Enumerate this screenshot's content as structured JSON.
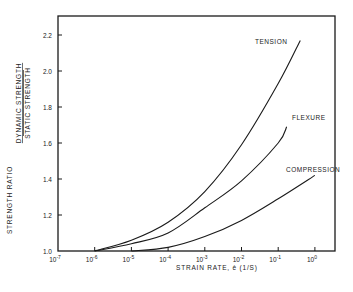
{
  "chart_data": {
    "type": "line",
    "title": "",
    "xlabel": "STRAIN RATE, ė (1/S)",
    "ylabel": "STRENGTH RATIO",
    "ylabel_fraction": {
      "numerator": "DYNAMIC STRENGTH",
      "denominator": "STATIC STRENGTH"
    },
    "xscale": "log",
    "xlim": [
      1e-07,
      3
    ],
    "ylim": [
      1.0,
      2.3
    ],
    "x_ticks": [
      "10-7",
      "10-6",
      "10-5",
      "10-4",
      "10-3",
      "10-2",
      "10-1",
      "100"
    ],
    "x_tick_exponents": [
      -7,
      -6,
      -5,
      -4,
      -3,
      -2,
      -1,
      0
    ],
    "y_ticks": [
      "1.0",
      "1.2",
      "1.4",
      "1.6",
      "1.8",
      "2.0",
      "2.2"
    ],
    "y_tick_values": [
      1.0,
      1.2,
      1.4,
      1.6,
      1.8,
      2.0,
      2.2
    ],
    "grid": false,
    "legend": "inline labels at curve ends",
    "series": [
      {
        "name": "TENSION",
        "x": [
          1e-06,
          1e-05,
          0.0001,
          0.001,
          0.01,
          0.1,
          0.4
        ],
        "y": [
          1.0,
          1.06,
          1.16,
          1.33,
          1.59,
          1.93,
          2.17
        ]
      },
      {
        "name": "FLEXURE",
        "x": [
          1e-06,
          1e-05,
          0.0001,
          0.001,
          0.01,
          0.1,
          0.17
        ],
        "y": [
          1.0,
          1.04,
          1.1,
          1.24,
          1.39,
          1.6,
          1.69
        ]
      },
      {
        "name": "COMPRESSION",
        "x": [
          1e-05,
          0.0001,
          0.001,
          0.01,
          0.1,
          1.0
        ],
        "y": [
          1.0,
          1.02,
          1.08,
          1.17,
          1.29,
          1.42
        ]
      }
    ]
  },
  "labels": {
    "ylabel_main": "STRENGTH RATIO",
    "ylabel_num": "DYNAMIC STRENGTH",
    "ylabel_den": "STATIC STRENGTH",
    "xlabel": "STRAIN RATE, ė (1/S)"
  }
}
